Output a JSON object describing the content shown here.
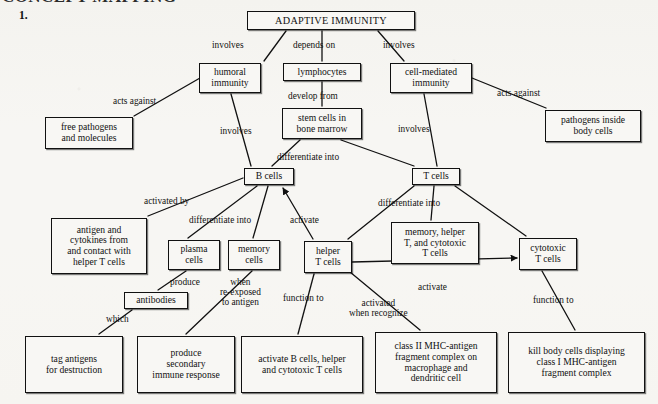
{
  "page": {
    "item_number": "1.",
    "cut_off_header": "CONCEPT MAPPING",
    "background_color": "#f7f6f3",
    "ink_color": "#111111",
    "width": 658,
    "height": 404
  },
  "diagram": {
    "type": "concept-map",
    "root": "ADAPTIVE IMMUNITY",
    "nodes": [
      {
        "id": "adaptive-immunity",
        "label": "ADAPTIVE IMMUNITY",
        "x": 247,
        "y": 11,
        "w": 168,
        "h": 19,
        "size": "title"
      },
      {
        "id": "humoral-immunity",
        "label": "humoral\nimmunity",
        "x": 199,
        "y": 63,
        "w": 62,
        "h": 30,
        "size": "std"
      },
      {
        "id": "lymphocytes",
        "label": "lymphocytes",
        "x": 283,
        "y": 63,
        "w": 78,
        "h": 18,
        "size": "std"
      },
      {
        "id": "cell-mediated-immunity",
        "label": "cell-mediated\nimmunity",
        "x": 390,
        "y": 63,
        "w": 82,
        "h": 30,
        "size": "std"
      },
      {
        "id": "free-pathogens",
        "label": "free pathogens\nand molecules",
        "x": 45,
        "y": 117,
        "w": 88,
        "h": 32,
        "size": "std"
      },
      {
        "id": "stem-cells",
        "label": "stem cells in\nbone marrow",
        "x": 282,
        "y": 108,
        "w": 80,
        "h": 31,
        "size": "std"
      },
      {
        "id": "pathogens-inside",
        "label": "pathogens inside\nbody cells",
        "x": 545,
        "y": 110,
        "w": 96,
        "h": 32,
        "size": "std"
      },
      {
        "id": "b-cells",
        "label": "B cells",
        "x": 244,
        "y": 168,
        "w": 50,
        "h": 17,
        "size": "std"
      },
      {
        "id": "t-cells",
        "label": "T cells",
        "x": 412,
        "y": 168,
        "w": 48,
        "h": 17,
        "size": "std"
      },
      {
        "id": "antigen-cytokines",
        "label": "antigen and\ncytokines from\nand contact with\nhelper T cells",
        "x": 51,
        "y": 218,
        "w": 96,
        "h": 56,
        "size": "std"
      },
      {
        "id": "plasma-cells",
        "label": "plasma\ncells",
        "x": 168,
        "y": 240,
        "w": 52,
        "h": 30,
        "size": "std"
      },
      {
        "id": "memory-cells",
        "label": "memory\ncells",
        "x": 228,
        "y": 240,
        "w": 52,
        "h": 30,
        "size": "std"
      },
      {
        "id": "helper-t-cells",
        "label": "helper\nT cells",
        "x": 304,
        "y": 241,
        "w": 48,
        "h": 32,
        "size": "std"
      },
      {
        "id": "memory-helper-cytotoxic",
        "label": "memory, helper\nT, and cytotoxic\nT cells",
        "x": 391,
        "y": 222,
        "w": 88,
        "h": 42,
        "size": "std"
      },
      {
        "id": "cytotoxic-t-cells",
        "label": "cytotoxic\nT cells",
        "x": 519,
        "y": 238,
        "w": 58,
        "h": 32,
        "size": "std"
      },
      {
        "id": "antibodies",
        "label": "antibodies",
        "x": 124,
        "y": 292,
        "w": 64,
        "h": 17,
        "size": "std"
      },
      {
        "id": "tag-antigens",
        "label": "tag antigens\nfor destruction",
        "x": 25,
        "y": 336,
        "w": 98,
        "h": 57,
        "size": "std"
      },
      {
        "id": "produce-secondary",
        "label": "produce\nsecondary\nimmune response",
        "x": 137,
        "y": 336,
        "w": 98,
        "h": 57,
        "size": "std"
      },
      {
        "id": "activate-b-cells",
        "label": "activate B cells, helper\nand cytotoxic T cells",
        "x": 241,
        "y": 336,
        "w": 122,
        "h": 57,
        "size": "std"
      },
      {
        "id": "class-ii-mhc",
        "label": "class II MHC-antigen\nfragment complex on\nmacrophage and\ndendritic cell",
        "x": 375,
        "y": 332,
        "w": 122,
        "h": 61,
        "size": "std"
      },
      {
        "id": "kill-body-cells",
        "label": "kill body cells displaying\nclass I MHC-antigen\nfragment complex",
        "x": 508,
        "y": 332,
        "w": 137,
        "h": 61,
        "size": "std"
      }
    ],
    "link_labels": [
      {
        "id": "l-involves-humoral",
        "text": "involves",
        "x": 212,
        "y": 40
      },
      {
        "id": "l-depends-on",
        "text": "depends on",
        "x": 293,
        "y": 40
      },
      {
        "id": "l-involves-cellmediated",
        "text": "involves",
        "x": 383,
        "y": 40
      },
      {
        "id": "l-acts-against-left",
        "text": "acts against",
        "x": 113,
        "y": 96
      },
      {
        "id": "l-develop-from",
        "text": "develop from",
        "x": 288,
        "y": 91
      },
      {
        "id": "l-acts-against-right",
        "text": "acts against",
        "x": 497,
        "y": 88
      },
      {
        "id": "l-involves-bcells",
        "text": "involves",
        "x": 220,
        "y": 126
      },
      {
        "id": "l-involves-tcells",
        "text": "involves",
        "x": 398,
        "y": 124
      },
      {
        "id": "l-differentiate-bcells",
        "text": "differentiate into",
        "x": 277,
        "y": 152
      },
      {
        "id": "l-activated-by",
        "text": "activated by",
        "x": 144,
        "y": 196
      },
      {
        "id": "l-differentiate-into-2",
        "text": "differentiate into",
        "x": 189,
        "y": 215
      },
      {
        "id": "l-activate-bcells",
        "text": "activate",
        "x": 290,
        "y": 215
      },
      {
        "id": "l-differentiate-tcells",
        "text": "differentiate into",
        "x": 378,
        "y": 198
      },
      {
        "id": "l-produce",
        "text": "produce",
        "x": 170,
        "y": 277
      },
      {
        "id": "l-when-reexposed",
        "text": "when\nre-exposed\nto antigen",
        "x": 220,
        "y": 277
      },
      {
        "id": "l-function-to-helper",
        "text": "function to",
        "x": 283,
        "y": 293
      },
      {
        "id": "l-activated-when",
        "text": "activated\nwhen recognize",
        "x": 349,
        "y": 298
      },
      {
        "id": "l-activate-cytotoxic",
        "text": "activate",
        "x": 418,
        "y": 282
      },
      {
        "id": "l-which",
        "text": "which",
        "x": 106,
        "y": 314
      },
      {
        "id": "l-function-to-cyto",
        "text": "function to",
        "x": 533,
        "y": 295
      }
    ],
    "edges": [
      {
        "from": "adaptive-immunity",
        "to": "humoral-immunity",
        "path": "M 286 31 L 264 61",
        "arrow": "none"
      },
      {
        "from": "adaptive-immunity",
        "to": "lymphocytes",
        "path": "M 322 31 L 322 61",
        "arrow": "none"
      },
      {
        "from": "adaptive-immunity",
        "to": "cell-mediated-immunity",
        "path": "M 378 31 L 404 61",
        "arrow": "none"
      },
      {
        "from": "humoral-immunity",
        "to": "free-pathogens",
        "path": "M 200 78 L 134 116",
        "arrow": "none"
      },
      {
        "from": "humoral-immunity",
        "to": "b-cells",
        "path": "M 231 94 L 251 166",
        "arrow": "none"
      },
      {
        "from": "lymphocytes",
        "to": "stem-cells",
        "path": "M 322 82 L 322 106",
        "arrow": "none"
      },
      {
        "from": "cell-mediated-immunity",
        "to": "pathogens-inside",
        "path": "M 472 78 L 546 108",
        "arrow": "none"
      },
      {
        "from": "cell-mediated-immunity",
        "to": "t-cells",
        "path": "M 424 94 L 437 166",
        "arrow": "none"
      },
      {
        "from": "stem-cells",
        "to": "b-cells",
        "path": "M 300 140 L 272 166",
        "arrow": "none"
      },
      {
        "from": "stem-cells",
        "to": "t-cells",
        "path": "M 341 140 L 414 166",
        "arrow": "none"
      },
      {
        "from": "b-cells",
        "to": "antigen-cytokines",
        "path": "M 243 178 L 148 216",
        "arrow": "none"
      },
      {
        "from": "b-cells",
        "to": "plasma-cells",
        "path": "M 257 186 L 188 238",
        "arrow": "none"
      },
      {
        "from": "b-cells",
        "to": "memory-cells",
        "path": "M 268 186 L 253 238",
        "arrow": "none"
      },
      {
        "from": "helper-t-cells",
        "to": "b-cells",
        "path": "M 313 239 L 283 188",
        "arrow": "end"
      },
      {
        "from": "t-cells",
        "to": "helper-t-cells",
        "path": "M 414 186 L 348 239",
        "arrow": "none"
      },
      {
        "from": "t-cells",
        "to": "memory-helper-cytotoxic",
        "path": "M 434 186 L 431 220",
        "arrow": "none"
      },
      {
        "from": "t-cells",
        "to": "cytotoxic-t-cells",
        "path": "M 455 186 L 526 236",
        "arrow": "none"
      },
      {
        "from": "plasma-cells",
        "to": "antibodies",
        "path": "M 186 271 L 158 290",
        "arrow": "none"
      },
      {
        "from": "memory-cells",
        "to": "produce-secondary",
        "path": "M 252 271 L 186 334",
        "arrow": "none"
      },
      {
        "from": "antibodies",
        "to": "tag-antigens",
        "path": "M 132 310 L 99 334",
        "arrow": "none"
      },
      {
        "from": "helper-t-cells",
        "to": "activate-b-cells",
        "path": "M 314 274 L 298 334",
        "arrow": "none"
      },
      {
        "from": "helper-t-cells",
        "to": "class-ii-mhc",
        "path": "M 350 272 L 420 330",
        "arrow": "none"
      },
      {
        "from": "helper-t-cells",
        "to": "cytotoxic-t-cells",
        "path": "M 352 262 L 517 258",
        "arrow": "end"
      },
      {
        "from": "cytotoxic-t-cells",
        "to": "kill-body-cells",
        "path": "M 542 271 L 575 330",
        "arrow": "none"
      }
    ]
  }
}
